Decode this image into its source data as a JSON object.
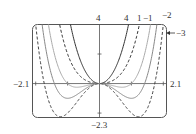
{
  "chart_data": {
    "type": "line",
    "title": "",
    "xlabel": "",
    "ylabel": "",
    "xlim": [
      -2.1,
      2.1
    ],
    "ylim": [
      -2.3,
      4
    ],
    "grid": false,
    "function_family": "y = x^4 + c x^2",
    "series": [
      {
        "name": "4",
        "c": 4,
        "style": "solid",
        "color": "#333333"
      },
      {
        "name": "1",
        "c": 1,
        "style": "dashed",
        "color": "#333333"
      },
      {
        "name": "-1",
        "c": -1,
        "style": "solid",
        "color": "#aaaaaa"
      },
      {
        "name": "-2",
        "c": -2,
        "style": "solid",
        "color": "#888888"
      },
      {
        "name": "-3",
        "c": -3,
        "style": "dashed",
        "color": "#444444"
      }
    ],
    "annotations": [
      "4",
      "1",
      "−1",
      "−2",
      "−3"
    ]
  },
  "axis_labels": {
    "xmin": "−2.1",
    "xmax": "2.1",
    "ymax": "4",
    "ymin": "−2.3"
  },
  "curve_labels": {
    "c4": "4",
    "c1": "1",
    "cm1": "−1",
    "cm2": "−2",
    "cm3": "−3"
  }
}
